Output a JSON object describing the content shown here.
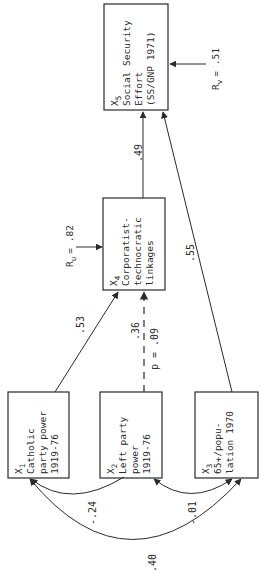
{
  "diagram": {
    "orientation": "rotated-90-ccw",
    "nodes": {
      "x1": {
        "var": "X",
        "sub": "1",
        "lines": [
          "Catholic",
          "party power",
          "1919-76"
        ]
      },
      "x2": {
        "var": "X",
        "sub": "2",
        "lines": [
          "Left party",
          "power",
          "1919-76"
        ]
      },
      "x3": {
        "var": "X",
        "sub": "3",
        "lines": [
          "65+/popu-",
          "lation 1970"
        ]
      },
      "x4": {
        "var": "X",
        "sub": "4",
        "lines": [
          "Corporatist-",
          "technocratic",
          "linkages"
        ]
      },
      "x5": {
        "var": "X",
        "sub": "5",
        "lines": [
          "Social Security",
          "Effort",
          "(SS/GNP 1971)"
        ]
      }
    },
    "paths": [
      {
        "from": "x1",
        "to": "x4",
        "coef": ".53",
        "style": "solid"
      },
      {
        "from": "x2",
        "to": "x4",
        "coef": ".36",
        "p": "p = .09",
        "style": "dashed"
      },
      {
        "from": "x4",
        "to": "x5",
        "coef": ".49",
        "style": "solid"
      },
      {
        "from": "x3",
        "to": "x5",
        "coef": ".55",
        "style": "solid"
      }
    ],
    "correlations": [
      {
        "between": [
          "x1",
          "x2"
        ],
        "coef": "-.24"
      },
      {
        "between": [
          "x2",
          "x3"
        ],
        "coef": "-.01"
      },
      {
        "between": [
          "x1",
          "x3"
        ],
        "coef": ".40"
      }
    ],
    "residuals": {
      "ru": {
        "label": "R",
        "sub": "u",
        "value": "= .82",
        "target": "x4"
      },
      "rv": {
        "label": "R",
        "sub": "v",
        "value": "= .51",
        "target": "x5"
      }
    }
  }
}
